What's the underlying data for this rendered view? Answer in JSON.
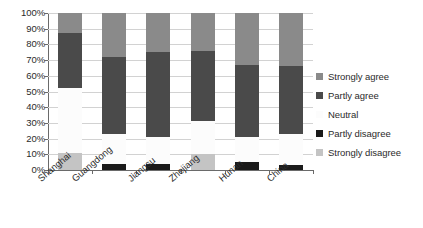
{
  "chart_data": {
    "type": "bar",
    "subtype": "stacked-percent",
    "title": "",
    "xlabel": "",
    "ylabel": "",
    "ylim": [
      0,
      100
    ],
    "ytick_labels": [
      "0%",
      "10%",
      "20%",
      "30%",
      "40%",
      "50%",
      "60%",
      "70%",
      "80%",
      "90%",
      "100%"
    ],
    "ytick_values": [
      0,
      10,
      20,
      30,
      40,
      50,
      60,
      70,
      80,
      90,
      100
    ],
    "grid": true,
    "legend_position": "right",
    "categories": [
      "Shanghai",
      "Guangdong",
      "Jiangsu",
      "Zhejiang",
      "Hunan",
      "China"
    ],
    "series": [
      {
        "name": "Strongly agree",
        "color": "#8a8a8a",
        "values": [
          13,
          28,
          25,
          24,
          33,
          34
        ]
      },
      {
        "name": "Partly agree",
        "color": "#4a4a4a",
        "values": [
          35,
          49,
          54,
          45,
          46,
          43
        ]
      },
      {
        "name": "Neutral",
        "color": "#fafafa",
        "values": [
          41,
          19,
          17,
          21,
          16,
          20
        ]
      },
      {
        "name": "Partly disagree",
        "color": "#1a1a1a",
        "values": [
          0,
          4,
          4,
          0,
          5,
          3
        ]
      },
      {
        "name": "Strongly disagree",
        "color": "#c4c4c4",
        "values": [
          11,
          0,
          0,
          10,
          0,
          0
        ]
      }
    ],
    "stack_order_bottom_to_top": [
      "Strongly disagree",
      "Partly disagree",
      "Neutral",
      "Partly agree",
      "Strongly agree"
    ],
    "cumulative_tops": {
      "Shanghai": {
        "Strongly disagree": 11,
        "Partly disagree": 11,
        "Neutral": 52,
        "Partly agree": 87,
        "Strongly agree": 100
      },
      "Guangdong": {
        "Strongly disagree": 0,
        "Partly disagree": 4,
        "Neutral": 23,
        "Partly agree": 72,
        "Strongly agree": 100
      },
      "Jiangsu": {
        "Strongly disagree": 0,
        "Partly disagree": 4,
        "Neutral": 21,
        "Partly agree": 75,
        "Strongly agree": 100
      },
      "Zhejiang": {
        "Strongly disagree": 10,
        "Partly disagree": 10,
        "Neutral": 31,
        "Partly agree": 76,
        "Strongly agree": 100
      },
      "Hunan": {
        "Strongly disagree": 0,
        "Partly disagree": 5,
        "Neutral": 21,
        "Partly agree": 67,
        "Strongly agree": 100
      },
      "China": {
        "Strongly disagree": 0,
        "Partly disagree": 3,
        "Neutral": 23,
        "Partly agree": 66,
        "Strongly agree": 100
      }
    }
  },
  "legend": {
    "items": [
      {
        "label": "Strongly agree",
        "color": "#8a8a8a"
      },
      {
        "label": "Partly agree",
        "color": "#4a4a4a"
      },
      {
        "label": "Neutral",
        "color": "#fafafa"
      },
      {
        "label": "Partly disagree",
        "color": "#1a1a1a"
      },
      {
        "label": "Strongly disagree",
        "color": "#c4c4c4"
      }
    ]
  },
  "style": {
    "background": "#ffffff",
    "gridline_color": "#d2d2d2",
    "axis_color": "#6a6a6a",
    "text_color": "#2b2b2b"
  }
}
